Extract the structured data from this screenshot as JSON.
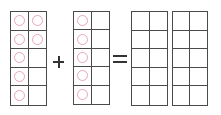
{
  "colors": {
    "grid_line": "#4a4a4a",
    "counter": "#e8a6b8",
    "operator": "#333333"
  },
  "frames": [
    {
      "id": "addend-1",
      "columns": 2,
      "rows": 5,
      "filled": [
        true,
        true,
        true,
        true,
        true,
        false,
        true,
        false,
        true,
        false
      ]
    },
    {
      "id": "addend-2",
      "columns": 2,
      "rows": 5,
      "filled": [
        true,
        false,
        true,
        false,
        true,
        false,
        true,
        false,
        true,
        false
      ]
    },
    {
      "id": "sum-1",
      "columns": 2,
      "rows": 5,
      "filled": [
        false,
        false,
        false,
        false,
        false,
        false,
        false,
        false,
        false,
        false
      ]
    },
    {
      "id": "sum-2",
      "columns": 2,
      "rows": 5,
      "filled": [
        false,
        false,
        false,
        false,
        false,
        false,
        false,
        false,
        false,
        false
      ]
    }
  ],
  "operators": {
    "plus": "+",
    "equals": "="
  },
  "counts": {
    "addend_1": 7,
    "addend_2": 5
  }
}
